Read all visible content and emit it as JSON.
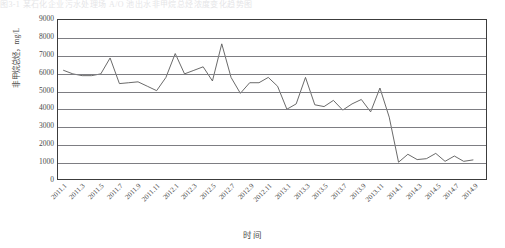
{
  "top_clip_text": "图3-1  某石化企业污水处理场 A/O 池出水非甲烷总烃浓度变化趋势图",
  "chart_data": {
    "type": "line",
    "title": "",
    "xlabel": "时间",
    "ylabel": "非甲烷总烃，mg/L",
    "ylim": [
      0,
      9000
    ],
    "ytick_values": [
      9000,
      8000,
      7000,
      6000,
      5000,
      4000,
      3000,
      2000,
      1000,
      0
    ],
    "ytick_labels": [
      "9000",
      "8000",
      "7000",
      "6000",
      "5000",
      "4000",
      "3000",
      "2000",
      "1000",
      "0"
    ],
    "grid": "horizontal",
    "legend": "none",
    "line_color": "#595959",
    "categories": [
      "2011.1",
      "2011.2",
      "2011.3",
      "2011.4",
      "2011.5",
      "2011.6",
      "2011.7",
      "2011.8",
      "2011.9",
      "2011.10",
      "2011.11",
      "2011.12",
      "2012.1",
      "2012.2",
      "2012.3",
      "2012.4",
      "2012.5",
      "2012.6",
      "2012.7",
      "2012.8",
      "2012.9",
      "2012.10",
      "2012.11",
      "2012.12",
      "2013.1",
      "2013.2",
      "2013.3",
      "2013.4",
      "2013.5",
      "2013.6",
      "2013.7",
      "2013.8",
      "2013.9",
      "2013.10",
      "2013.11",
      "2013.12",
      "2014.1",
      "2014.2",
      "2014.3",
      "2014.4",
      "2014.5",
      "2014.6",
      "2014.7",
      "2014.8",
      "2014.9"
    ],
    "xtick_labels": [
      "2011.1",
      "2011.3",
      "2011.5",
      "2011.7",
      "2011.9",
      "2011.11",
      "2012.1",
      "2012.3",
      "2012.5",
      "2012.7",
      "2012.9",
      "2012.11",
      "2013.1",
      "2013.3",
      "2013.5",
      "2013.7",
      "2013.9",
      "2013.11",
      "2014.1",
      "2014.3",
      "2014.5",
      "2014.7",
      "2014.9"
    ],
    "values": [
      6150,
      5950,
      5850,
      5850,
      5950,
      6850,
      5400,
      5450,
      5500,
      5250,
      5000,
      5750,
      7100,
      5950,
      6150,
      6350,
      5550,
      7650,
      5750,
      4850,
      5450,
      5450,
      5750,
      5250,
      3950,
      4250,
      5750,
      4200,
      4100,
      4450,
      3900,
      4250,
      4500,
      3800,
      5150,
      3500,
      950,
      1400,
      1100,
      1150,
      1450,
      1000,
      1300,
      1000,
      1080
    ]
  }
}
